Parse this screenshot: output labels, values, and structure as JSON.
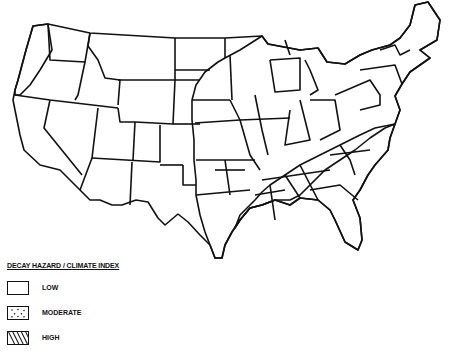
{
  "map": {
    "subject": "Contiguous United States",
    "pattern_colors": {
      "ink": "#111111",
      "paper": "#ffffff"
    }
  },
  "legend": {
    "title": "DECAY HAZARD / CLIMATE INDEX",
    "items": [
      {
        "label": "LOW",
        "pattern": "blank"
      },
      {
        "label": "MODERATE",
        "pattern": "dots"
      },
      {
        "label": "HIGH",
        "pattern": "diagonal-hatch"
      }
    ]
  },
  "regions": {
    "low": [
      "Interior West",
      "Great Plains (west)",
      "Southwest",
      "Texas (west)",
      "California",
      "Nevada",
      "Idaho",
      "Montana",
      "Wyoming",
      "Utah",
      "Colorado",
      "Arizona",
      "New Mexico",
      "Oregon (east)",
      "Washington (east)"
    ],
    "moderate": [
      "Pacific Northwest coast",
      "Dakotas (east)",
      "Nebraska (east)",
      "Kansas (east)",
      "Oklahoma (east)",
      "Texas (east)",
      "Minnesota",
      "Iowa",
      "Missouri",
      "Wisconsin",
      "Illinois",
      "Michigan",
      "Indiana",
      "Ohio",
      "Kentucky",
      "Arkansas",
      "Pennsylvania",
      "New York",
      "New England",
      "Mid-Atlantic"
    ],
    "high": [
      "Louisiana",
      "Mississippi",
      "Alabama",
      "Georgia",
      "Florida",
      "South Carolina",
      "North Carolina",
      "Tennessee (part)",
      "Virginia (part)"
    ]
  },
  "caption": ""
}
